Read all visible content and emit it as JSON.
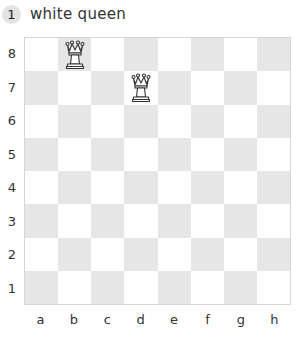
{
  "header": {
    "number": "1",
    "title": "white queen"
  },
  "board": {
    "ranks": [
      "8",
      "7",
      "6",
      "5",
      "4",
      "3",
      "2",
      "1"
    ],
    "files": [
      "a",
      "b",
      "c",
      "d",
      "e",
      "f",
      "g",
      "h"
    ],
    "light_color": "#ffffff",
    "dark_color": "#e6e6e6",
    "pieces": [
      {
        "square": "b8",
        "piece": "white-queen"
      },
      {
        "square": "d7",
        "piece": "white-queen"
      }
    ]
  }
}
